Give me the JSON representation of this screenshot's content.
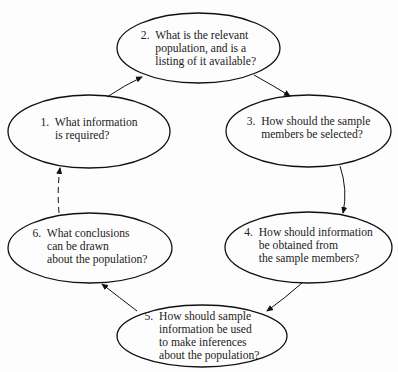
{
  "diagram": {
    "type": "cycle",
    "stroke_color": "#111111",
    "nodes": [
      {
        "id": 1,
        "label": "1.  What information\n     is required?"
      },
      {
        "id": 2,
        "label": "2.  What is the relevant\n     population, and is a\n     listing of it available?"
      },
      {
        "id": 3,
        "label": "3.  How should the sample\n     members be selected?"
      },
      {
        "id": 4,
        "label": "4.  How should information\n     be obtained from\n     the sample members?"
      },
      {
        "id": 5,
        "label": "5.  How should sample\n     information be used\n     to make inferences\n     about the population?"
      },
      {
        "id": 6,
        "label": "6.  What conclusions\n     can be drawn\n     about the population?"
      }
    ],
    "edges": [
      {
        "from": 1,
        "to": 2,
        "style": "solid"
      },
      {
        "from": 2,
        "to": 3,
        "style": "solid"
      },
      {
        "from": 3,
        "to": 4,
        "style": "solid"
      },
      {
        "from": 4,
        "to": 5,
        "style": "solid"
      },
      {
        "from": 5,
        "to": 6,
        "style": "solid"
      },
      {
        "from": 6,
        "to": 1,
        "style": "dashed"
      }
    ]
  }
}
